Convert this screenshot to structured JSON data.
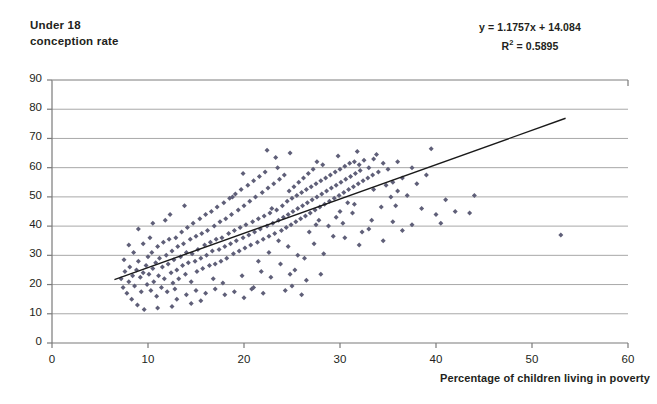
{
  "chart_data": {
    "type": "scatter",
    "title": "Under 18 conception rate",
    "ylabel_line1": "Under 18",
    "ylabel_line2": "conception rate",
    "xlabel": "Percentage of children living in poverty",
    "xlim": [
      0,
      60
    ],
    "ylim": [
      0,
      90
    ],
    "xticks": [
      0,
      10,
      20,
      30,
      40,
      50,
      60
    ],
    "yticks": [
      0,
      10,
      20,
      30,
      40,
      50,
      60,
      70,
      80,
      90
    ],
    "grid": "horizontal",
    "legend": "none",
    "marker_color": "#5f5f78",
    "marker_shape": "diamond",
    "trendline_color": "#1a1a1a",
    "gridline_color": "#a8a8a8",
    "annotations": {
      "equation": "y = 1.1757x + 14.084",
      "r_squared_prefix": "R",
      "r_squared_sup": "2",
      "r_squared_value": " = 0.5895",
      "slope": 1.1757,
      "intercept": 14.084,
      "r_squared": 0.5895
    },
    "trendline": {
      "x_start": 6.5,
      "y_start": 21.7,
      "x_end": 53.5,
      "y_end": 76.9
    },
    "points": [
      [
        7.2,
        22.0
      ],
      [
        7.4,
        19.0
      ],
      [
        7.6,
        24.5
      ],
      [
        7.8,
        17.0
      ],
      [
        8.0,
        21.0
      ],
      [
        8.1,
        26.0
      ],
      [
        8.3,
        15.0
      ],
      [
        8.4,
        23.0
      ],
      [
        8.6,
        19.5
      ],
      [
        8.8,
        25.0
      ],
      [
        8.9,
        13.0
      ],
      [
        9.0,
        28.0
      ],
      [
        9.2,
        22.5
      ],
      [
        9.3,
        17.5
      ],
      [
        9.5,
        24.0
      ],
      [
        9.6,
        11.5
      ],
      [
        9.8,
        26.5
      ],
      [
        9.9,
        20.0
      ],
      [
        10.0,
        29.5
      ],
      [
        10.1,
        23.5
      ],
      [
        10.3,
        18.0
      ],
      [
        10.4,
        31.0
      ],
      [
        10.5,
        25.5
      ],
      [
        10.6,
        21.0
      ],
      [
        10.8,
        27.5
      ],
      [
        10.9,
        16.0
      ],
      [
        11.0,
        33.0
      ],
      [
        11.1,
        23.0
      ],
      [
        11.2,
        29.0
      ],
      [
        11.4,
        19.0
      ],
      [
        11.5,
        26.0
      ],
      [
        11.6,
        34.5
      ],
      [
        11.7,
        22.0
      ],
      [
        11.9,
        30.0
      ],
      [
        12.0,
        17.5
      ],
      [
        12.1,
        27.0
      ],
      [
        12.2,
        35.5
      ],
      [
        12.4,
        24.0
      ],
      [
        12.5,
        31.5
      ],
      [
        12.6,
        20.5
      ],
      [
        12.7,
        28.5
      ],
      [
        12.9,
        36.0
      ],
      [
        13.0,
        25.0
      ],
      [
        13.1,
        33.0
      ],
      [
        13.2,
        22.0
      ],
      [
        13.4,
        29.5
      ],
      [
        13.5,
        38.0
      ],
      [
        13.6,
        26.5
      ],
      [
        13.7,
        34.0
      ],
      [
        13.9,
        23.5
      ],
      [
        14.0,
        31.0
      ],
      [
        14.1,
        39.5
      ],
      [
        14.2,
        27.5
      ],
      [
        14.4,
        35.5
      ],
      [
        14.5,
        21.0
      ],
      [
        14.6,
        30.5
      ],
      [
        14.7,
        41.0
      ],
      [
        14.9,
        28.0
      ],
      [
        15.0,
        36.5
      ],
      [
        15.1,
        24.5
      ],
      [
        15.2,
        32.0
      ],
      [
        15.4,
        42.5
      ],
      [
        15.5,
        29.0
      ],
      [
        15.6,
        37.5
      ],
      [
        15.7,
        25.5
      ],
      [
        15.9,
        33.5
      ],
      [
        16.0,
        44.0
      ],
      [
        16.1,
        30.0
      ],
      [
        16.2,
        38.5
      ],
      [
        16.4,
        26.5
      ],
      [
        16.5,
        34.5
      ],
      [
        16.6,
        45.0
      ],
      [
        16.7,
        31.5
      ],
      [
        16.9,
        40.0
      ],
      [
        17.0,
        27.0
      ],
      [
        17.1,
        35.5
      ],
      [
        17.2,
        46.5
      ],
      [
        17.4,
        32.0
      ],
      [
        17.5,
        41.5
      ],
      [
        17.6,
        28.0
      ],
      [
        17.7,
        36.0
      ],
      [
        17.9,
        48.0
      ],
      [
        18.0,
        33.0
      ],
      [
        18.1,
        42.5
      ],
      [
        18.2,
        29.0
      ],
      [
        18.4,
        37.5
      ],
      [
        18.5,
        49.5
      ],
      [
        18.6,
        34.0
      ],
      [
        18.7,
        44.0
      ],
      [
        18.9,
        30.5
      ],
      [
        19.0,
        38.5
      ],
      [
        19.1,
        51.0
      ],
      [
        19.2,
        35.0
      ],
      [
        19.4,
        45.5
      ],
      [
        19.5,
        31.5
      ],
      [
        19.6,
        39.5
      ],
      [
        19.7,
        52.5
      ],
      [
        19.9,
        36.0
      ],
      [
        20.0,
        47.0
      ],
      [
        20.1,
        32.5
      ],
      [
        20.2,
        40.5
      ],
      [
        20.4,
        54.0
      ],
      [
        20.5,
        37.0
      ],
      [
        20.6,
        48.5
      ],
      [
        20.7,
        33.5
      ],
      [
        20.9,
        41.5
      ],
      [
        21.0,
        55.5
      ],
      [
        21.1,
        38.0
      ],
      [
        21.2,
        50.0
      ],
      [
        21.4,
        34.5
      ],
      [
        21.5,
        42.5
      ],
      [
        21.6,
        57.0
      ],
      [
        21.7,
        39.0
      ],
      [
        21.9,
        51.5
      ],
      [
        22.0,
        35.5
      ],
      [
        22.1,
        43.5
      ],
      [
        22.2,
        58.5
      ],
      [
        22.4,
        40.0
      ],
      [
        22.5,
        53.0
      ],
      [
        22.6,
        36.5
      ],
      [
        22.7,
        44.5
      ],
      [
        22.9,
        46.0
      ],
      [
        23.0,
        41.0
      ],
      [
        23.1,
        54.5
      ],
      [
        23.2,
        37.5
      ],
      [
        23.4,
        45.5
      ],
      [
        23.5,
        60.0
      ],
      [
        23.6,
        42.0
      ],
      [
        23.7,
        56.0
      ],
      [
        23.9,
        38.5
      ],
      [
        24.0,
        47.0
      ],
      [
        24.1,
        43.0
      ],
      [
        24.2,
        57.5
      ],
      [
        24.4,
        39.5
      ],
      [
        24.5,
        48.5
      ],
      [
        24.6,
        44.0
      ],
      [
        24.7,
        52.0
      ],
      [
        24.9,
        40.5
      ],
      [
        25.0,
        49.5
      ],
      [
        25.1,
        45.0
      ],
      [
        25.2,
        53.5
      ],
      [
        25.4,
        41.5
      ],
      [
        25.5,
        50.5
      ],
      [
        25.6,
        46.0
      ],
      [
        25.7,
        55.0
      ],
      [
        25.9,
        42.5
      ],
      [
        26.0,
        51.5
      ],
      [
        26.1,
        47.0
      ],
      [
        26.2,
        56.5
      ],
      [
        26.4,
        43.5
      ],
      [
        26.5,
        52.5
      ],
      [
        26.6,
        48.0
      ],
      [
        26.7,
        58.0
      ],
      [
        26.9,
        44.5
      ],
      [
        27.0,
        53.5
      ],
      [
        27.1,
        49.0
      ],
      [
        27.2,
        59.5
      ],
      [
        27.4,
        45.5
      ],
      [
        27.5,
        54.5
      ],
      [
        27.6,
        50.0
      ],
      [
        27.9,
        46.5
      ],
      [
        28.0,
        55.5
      ],
      [
        28.1,
        51.0
      ],
      [
        28.2,
        61.0
      ],
      [
        28.4,
        47.5
      ],
      [
        28.5,
        56.5
      ],
      [
        28.6,
        52.0
      ],
      [
        28.9,
        48.5
      ],
      [
        29.0,
        57.5
      ],
      [
        29.1,
        53.0
      ],
      [
        29.4,
        49.5
      ],
      [
        29.5,
        58.5
      ],
      [
        29.6,
        54.0
      ],
      [
        29.9,
        50.5
      ],
      [
        30.0,
        59.5
      ],
      [
        30.1,
        55.0
      ],
      [
        30.4,
        51.5
      ],
      [
        30.5,
        60.5
      ],
      [
        30.6,
        56.0
      ],
      [
        30.9,
        52.5
      ],
      [
        31.0,
        61.5
      ],
      [
        31.1,
        57.0
      ],
      [
        31.4,
        53.5
      ],
      [
        31.5,
        62.0
      ],
      [
        31.6,
        58.0
      ],
      [
        31.9,
        54.5
      ],
      [
        32.0,
        61.0
      ],
      [
        32.1,
        59.0
      ],
      [
        32.4,
        55.5
      ],
      [
        32.5,
        62.5
      ],
      [
        32.9,
        56.5
      ],
      [
        33.0,
        60.0
      ],
      [
        33.4,
        57.5
      ],
      [
        33.5,
        63.0
      ],
      [
        34.0,
        58.5
      ],
      [
        34.5,
        61.5
      ],
      [
        35.0,
        59.5
      ],
      [
        35.5,
        55.0
      ],
      [
        36.0,
        52.0
      ],
      [
        36.5,
        56.5
      ],
      [
        9.5,
        34.0
      ],
      [
        10.2,
        36.0
      ],
      [
        11.8,
        42.0
      ],
      [
        12.3,
        44.0
      ],
      [
        13.8,
        47.0
      ],
      [
        16.8,
        22.0
      ],
      [
        17.8,
        20.5
      ],
      [
        19.8,
        23.0
      ],
      [
        21.8,
        24.5
      ],
      [
        22.8,
        22.5
      ],
      [
        23.8,
        27.0
      ],
      [
        24.8,
        23.5
      ],
      [
        20.8,
        18.5
      ],
      [
        18.8,
        50.0
      ],
      [
        19.9,
        58.0
      ],
      [
        23.3,
        63.5
      ],
      [
        24.3,
        18.0
      ],
      [
        25.3,
        25.0
      ],
      [
        26.3,
        29.0
      ],
      [
        27.3,
        34.0
      ],
      [
        28.3,
        30.5
      ],
      [
        29.3,
        36.5
      ],
      [
        30.3,
        41.0
      ],
      [
        31.3,
        44.5
      ],
      [
        32.3,
        38.0
      ],
      [
        33.3,
        42.0
      ],
      [
        34.3,
        46.5
      ],
      [
        35.3,
        50.0
      ],
      [
        22.4,
        66.0
      ],
      [
        24.8,
        65.0
      ],
      [
        27.6,
        62.0
      ],
      [
        29.8,
        64.0
      ],
      [
        31.8,
        65.5
      ],
      [
        33.8,
        64.5
      ],
      [
        36.0,
        62.0
      ],
      [
        37.5,
        60.0
      ],
      [
        37.0,
        50.5
      ],
      [
        38.0,
        54.5
      ],
      [
        38.5,
        46.0
      ],
      [
        39.0,
        57.5
      ],
      [
        39.5,
        66.5
      ],
      [
        40.0,
        44.0
      ],
      [
        40.5,
        41.0
      ],
      [
        41.0,
        49.0
      ],
      [
        42.0,
        45.0
      ],
      [
        43.5,
        44.5
      ],
      [
        44.0,
        50.5
      ],
      [
        30.5,
        36.0
      ],
      [
        32.0,
        33.5
      ],
      [
        33.0,
        39.0
      ],
      [
        34.5,
        35.0
      ],
      [
        35.5,
        41.5
      ],
      [
        28.0,
        23.5
      ],
      [
        26.5,
        21.5
      ],
      [
        25.0,
        19.5
      ],
      [
        30.0,
        45.0
      ],
      [
        31.5,
        47.5
      ],
      [
        36.5,
        38.5
      ],
      [
        37.5,
        40.5
      ],
      [
        53.0,
        37.0
      ],
      [
        14.5,
        13.5
      ],
      [
        15.5,
        14.5
      ],
      [
        12.5,
        12.5
      ],
      [
        13.0,
        15.0
      ],
      [
        11.0,
        12.0
      ],
      [
        8.5,
        31.0
      ],
      [
        9.0,
        39.0
      ],
      [
        10.5,
        41.0
      ],
      [
        7.5,
        28.5
      ],
      [
        8.0,
        33.5
      ],
      [
        16.0,
        17.0
      ],
      [
        17.0,
        18.5
      ],
      [
        18.0,
        16.5
      ],
      [
        19.0,
        17.5
      ],
      [
        20.0,
        15.5
      ],
      [
        21.0,
        19.0
      ],
      [
        22.0,
        17.0
      ],
      [
        14.0,
        16.5
      ],
      [
        15.0,
        18.0
      ],
      [
        12.8,
        18.5
      ],
      [
        21.5,
        28.0
      ],
      [
        22.6,
        31.0
      ],
      [
        23.6,
        35.0
      ],
      [
        24.6,
        33.0
      ],
      [
        25.6,
        30.0
      ],
      [
        26.8,
        38.0
      ],
      [
        27.8,
        42.0
      ],
      [
        28.8,
        40.0
      ],
      [
        29.6,
        43.0
      ],
      [
        30.8,
        48.0
      ],
      [
        26.0,
        16.5
      ],
      [
        27.5,
        40.5
      ],
      [
        33.5,
        52.5
      ],
      [
        34.8,
        54.0
      ],
      [
        35.8,
        47.0
      ]
    ]
  }
}
